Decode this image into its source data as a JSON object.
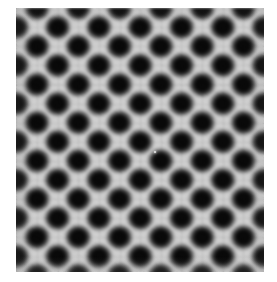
{
  "image": {
    "title": "Blurred checkerboard test pattern",
    "kind": "grayscale-raster",
    "canvas": {
      "width_px": 277,
      "height_px": 282,
      "margin_color": "#ffffff"
    },
    "plate": {
      "left_px": 16,
      "top_px": 8,
      "width_px": 248,
      "height_px": 264,
      "background_color": "#cdcdcd"
    },
    "pattern": {
      "type": "checkerboard-diamond-lattice",
      "motif": "diamond",
      "dark_color": "#080808",
      "light_color": "#cdcdcd",
      "columns_visible": 6,
      "rows_visible": 7,
      "cell_width_px": 41.3,
      "cell_height_px": 38.2,
      "rotation_deg": 45,
      "blur_radius_px": 4.5,
      "edges_clipped": true
    },
    "artifacts": {
      "grain_opacity": 0.16,
      "seam_opacity": 0.55,
      "defect": {
        "label": "bright-dust-speck",
        "x_px": 155,
        "y_px": 152,
        "diameter_px": 2
      }
    }
  }
}
